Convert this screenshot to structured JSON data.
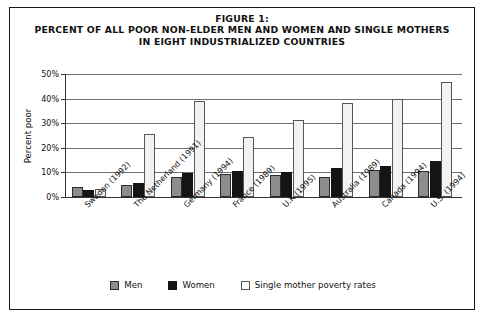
{
  "figure": {
    "title_lines": [
      "FIGURE 1:",
      "PERCENT OF ALL POOR NON-ELDER MEN AND WOMEN AND SINGLE MOTHERS",
      "IN EIGHT INDUSTRIALIZED COUNTRIES"
    ]
  },
  "chart_data": {
    "type": "bar",
    "title": "FIGURE 1: PERCENT OF ALL POOR NON-ELDER MEN AND WOMEN AND SINGLE MOTHERS IN EIGHT INDUSTRIALIZED COUNTRIES",
    "xlabel": "",
    "ylabel": "Percent poor",
    "ylim": [
      0,
      50
    ],
    "ytick_labels": [
      "0%",
      "10%",
      "20%",
      "30%",
      "40%",
      "50%"
    ],
    "ytick_values": [
      0,
      10,
      20,
      30,
      40,
      50
    ],
    "grid": true,
    "legend_position": "bottom",
    "categories": [
      "Sweden (1992)",
      "The Netherland (1991)",
      "Germany (1994)",
      "France (1989)",
      "U.K (1995)",
      "Australia (1989)",
      "Canada (1994)",
      "U.S. (1994)"
    ],
    "series": [
      {
        "name": "Men",
        "color": "#8d8d8d",
        "values": [
          4.0,
          4.8,
          8.0,
          9.5,
          8.8,
          8.0,
          11.0,
          10.5
        ]
      },
      {
        "name": "Women",
        "color": "#141414",
        "values": [
          3.0,
          5.5,
          9.8,
          10.5,
          10.2,
          11.8,
          12.7,
          14.5
        ]
      },
      {
        "name": "Single mother poverty rates",
        "color": "#f2f2f2",
        "values": [
          3.2,
          25.5,
          39.0,
          24.5,
          31.5,
          38.3,
          40.0,
          46.8
        ]
      }
    ]
  },
  "legend": {
    "items": [
      {
        "label": "Men"
      },
      {
        "label": "Women"
      },
      {
        "label": "Single mother poverty rates"
      }
    ]
  }
}
